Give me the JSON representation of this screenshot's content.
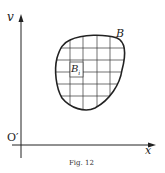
{
  "figure": {
    "caption": "Fig. 12",
    "axis_y_label": "v",
    "axis_x_label": "x",
    "origin_label": "O′",
    "region_label": "B",
    "cell_label": "B",
    "cell_subscript": "i"
  },
  "colors": {
    "ink": "#222222",
    "background": "#ffffff"
  }
}
